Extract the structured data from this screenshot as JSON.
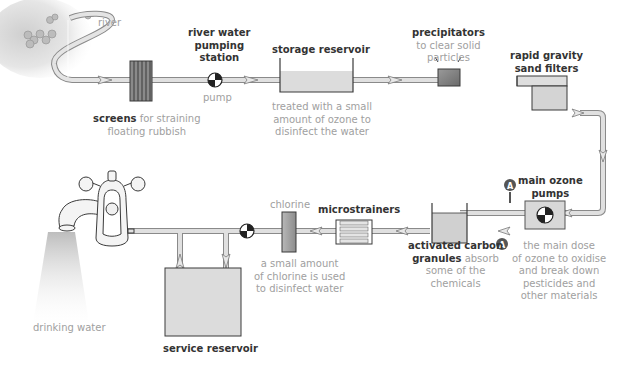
{
  "diagram": {
    "type": "water treatment process flow",
    "colors": {
      "pipe_fill": "#d8d8d8",
      "pipe_stroke": "#8a8a8a",
      "tank_fill": "#dcdcdc",
      "outline": "#3a3a3a",
      "label_bold": "#333333",
      "label_light": "#9a9a9a",
      "marker_A": "#555555"
    },
    "labels": {
      "river": "river",
      "screens_bold": "screens",
      "screens_desc_1": " for straining",
      "screens_desc_2": "floating rubbish",
      "pumping_1": "river water",
      "pumping_2": "pumping",
      "pumping_3": "station",
      "pump": "pump",
      "storage_title": "storage reservoir",
      "storage_desc_1": "treated with a small",
      "storage_desc_2": "amount of ozone to",
      "storage_desc_3": "disinfect the water",
      "precip_title": "precipitators",
      "precip_desc_1": "to clear solid",
      "precip_desc_2": "particles",
      "sand_1": "rapid gravity",
      "sand_2": "sand filters",
      "ozone_1": "main ozone",
      "ozone_2": "pumps",
      "ozone_marker": "A",
      "ozone_desc_1": "the main dose",
      "ozone_desc_2": "of ozone to oxidise",
      "ozone_desc_3": "and break down",
      "ozone_desc_4": "pesticides and",
      "ozone_desc_5": "other materials",
      "carbon_1": "activated carbon",
      "carbon_2_bold": "granules",
      "carbon_2_desc": " absorb",
      "carbon_3": "some of the",
      "carbon_4": "chemicals",
      "micro_title": "microstrainers",
      "chlorine_title": "chlorine",
      "chlorine_desc_1": "a small amount",
      "chlorine_desc_2": "of chlorine is used",
      "chlorine_desc_3": "to disinfect water",
      "service_title": "service reservoir",
      "drinking": "drinking water"
    }
  }
}
